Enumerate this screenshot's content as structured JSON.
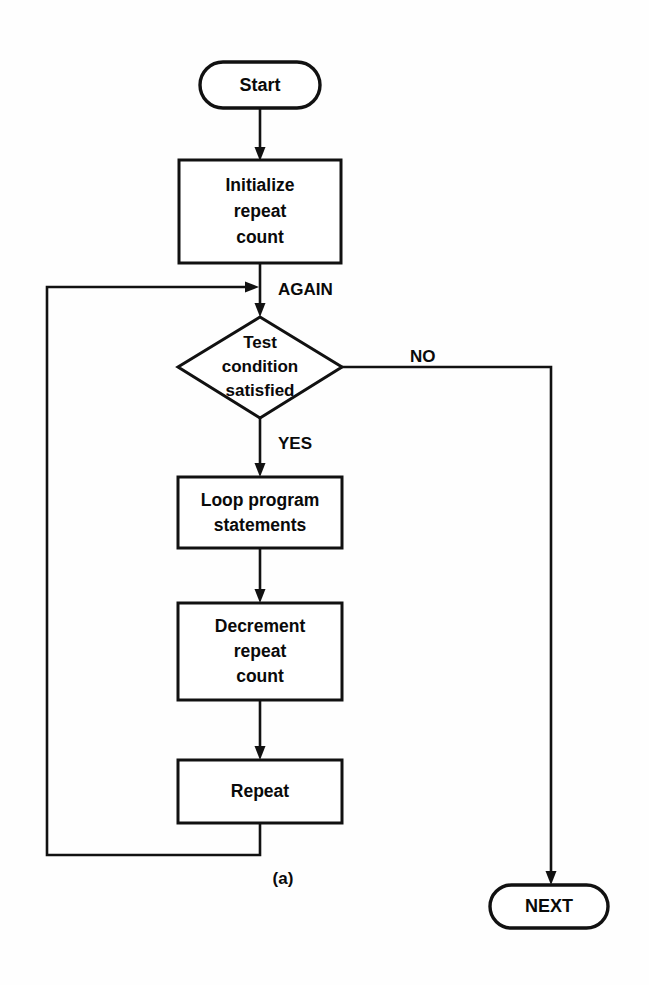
{
  "figure": {
    "caption": "(a)",
    "background_color": "#fefefe",
    "line_color": "#111111",
    "text_color": "#0a0a0a",
    "shape_fill": "#ffffff"
  },
  "nodes": [
    {
      "id": "start",
      "type": "terminator",
      "label": "Start",
      "lines": [
        "Start"
      ],
      "x": 260,
      "y": 85,
      "width": 120,
      "height": 46
    },
    {
      "id": "initialize",
      "type": "process",
      "label": "Initialize repeat count",
      "lines": [
        "Initialize",
        "repeat",
        "count"
      ],
      "x": 260,
      "y": 211,
      "width": 162,
      "height": 103
    },
    {
      "id": "test",
      "type": "decision",
      "label": "Test condition satisfied",
      "lines": [
        "Test",
        "condition",
        "satisfied"
      ],
      "x": 260,
      "y": 367,
      "width": 164,
      "height": 101
    },
    {
      "id": "loop-program",
      "type": "process",
      "label": "Loop program statements",
      "lines": [
        "Loop program",
        "statements"
      ],
      "x": 260,
      "y": 512,
      "width": 164,
      "height": 71
    },
    {
      "id": "decrement",
      "type": "process",
      "label": "Decrement repeat count",
      "lines": [
        "Decrement",
        "repeat",
        "count"
      ],
      "x": 260,
      "y": 651,
      "width": 164,
      "height": 97
    },
    {
      "id": "repeat",
      "type": "process",
      "label": "Repeat",
      "lines": [
        "Repeat"
      ],
      "x": 260,
      "y": 791,
      "width": 164,
      "height": 63
    },
    {
      "id": "next",
      "type": "terminator",
      "label": "NEXT",
      "lines": [
        "NEXT"
      ],
      "x": 549,
      "y": 906,
      "width": 118,
      "height": 43
    }
  ],
  "edge_labels": [
    {
      "id": "again",
      "text": "AGAIN",
      "x": 278,
      "y": 288
    },
    {
      "id": "no",
      "text": "NO",
      "x": 410,
      "y": 357
    },
    {
      "id": "yes",
      "text": "YES",
      "x": 278,
      "y": 442
    }
  ],
  "edges": [
    {
      "id": "start-to-initialize",
      "from": "start",
      "to": "initialize",
      "label": ""
    },
    {
      "id": "initialize-to-test",
      "from": "initialize",
      "to": "test",
      "label": "AGAIN"
    },
    {
      "id": "test-yes-to-loop",
      "from": "test",
      "to": "loop-program",
      "label": "YES"
    },
    {
      "id": "test-no-to-next",
      "from": "test",
      "to": "next",
      "label": "NO"
    },
    {
      "id": "loop-to-decrement",
      "from": "loop-program",
      "to": "decrement",
      "label": ""
    },
    {
      "id": "decrement-to-repeat",
      "from": "decrement",
      "to": "repeat",
      "label": ""
    },
    {
      "id": "repeat-back-to-again",
      "from": "repeat",
      "to": "test",
      "label": ""
    }
  ]
}
